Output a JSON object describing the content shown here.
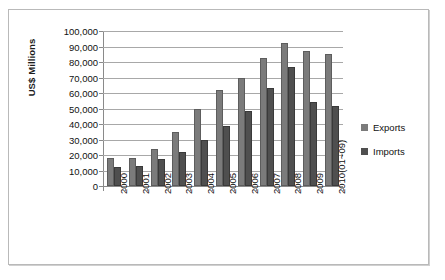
{
  "chart_data": {
    "type": "bar",
    "title": "",
    "subtitle": "",
    "xlabel": "",
    "ylabel": "US$ Millions",
    "ylim": [
      0,
      100000
    ],
    "yticks": [
      "0",
      "10,000",
      "20,000",
      "30,000",
      "40,000",
      "50,000",
      "60,000",
      "70,000",
      "80,000",
      "90,000",
      "100,000"
    ],
    "ytick_values": [
      0,
      10000,
      20000,
      30000,
      40000,
      50000,
      60000,
      70000,
      80000,
      90000,
      100000
    ],
    "grid": true,
    "legend_position": "right",
    "categories": [
      "2000",
      "2001",
      "2002",
      "2003",
      "2004",
      "2005",
      "2006",
      "2007",
      "2008",
      "2009",
      "2010(01~09)"
    ],
    "series": [
      {
        "name": "Exports",
        "color": "#7b7b7b",
        "values": [
          18000,
          17800,
          23700,
          35000,
          49500,
          62000,
          69500,
          82500,
          92000,
          87000,
          85000
        ]
      },
      {
        "name": "Imports",
        "color": "#4f4f4f",
        "values": [
          12200,
          13000,
          17400,
          22000,
          29800,
          38800,
          48500,
          63500,
          77000,
          54000,
          51500
        ]
      }
    ]
  },
  "legend": {
    "items": [
      {
        "label": "Exports",
        "swatch": "exports"
      },
      {
        "label": "Imports",
        "swatch": "imports"
      }
    ]
  }
}
